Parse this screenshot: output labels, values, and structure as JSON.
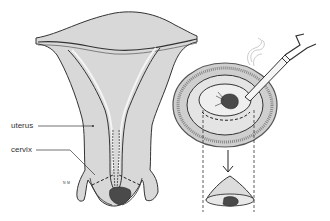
{
  "diagram": {
    "type": "medical-illustration",
    "labels": {
      "uterus": "uterus",
      "cervix": "cervix",
      "artist_initials": "N M"
    },
    "panels": [
      {
        "id": "left",
        "depicts": "Frontal cross-section of uterus and cervix with dashed cone-shaped excision lines at cervix"
      },
      {
        "id": "right-top",
        "depicts": "Face-on view of cervix with lesion; scalpel/electrosurgical loop instrument with smoke, dashed circle marking excision area"
      },
      {
        "id": "right-bottom",
        "depicts": "Excised cone-shaped tissue specimen containing dark lesion"
      }
    ],
    "colors": {
      "tissue_fill": "#d8d8d8",
      "outline": "#333333",
      "lesion": "#4a4a4a",
      "background": "#ffffff"
    }
  }
}
